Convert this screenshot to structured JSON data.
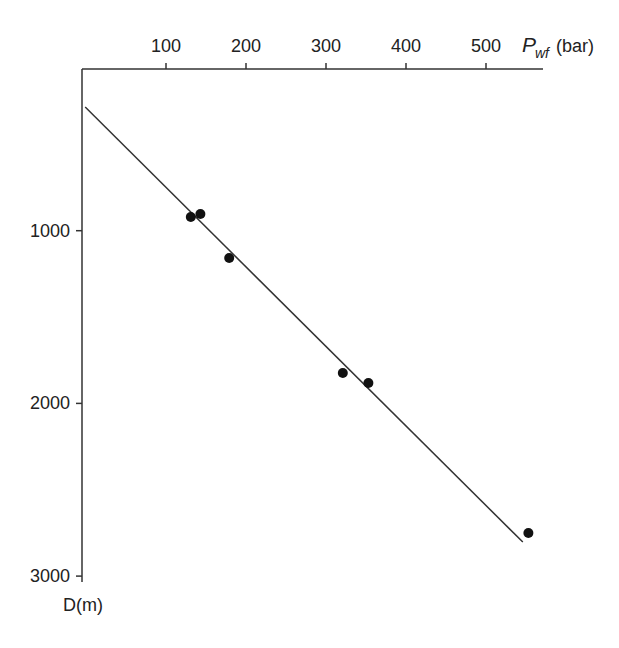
{
  "chart_data": {
    "type": "scatter",
    "title": "",
    "xlabel": "Pwf (bar)",
    "xlabel_main": "P",
    "xlabel_sub": "wf",
    "xlabel_unit": "(bar)",
    "ylabel": "D(m)",
    "x_axis_position": "top",
    "y_axis_inverted": true,
    "xlim": [
      0,
      570
    ],
    "ylim": [
      3000,
      64
    ],
    "x_ticks": [
      100,
      200,
      300,
      400,
      500
    ],
    "y_ticks": [
      1000,
      2000,
      3000
    ],
    "grid": false,
    "legend": null,
    "series": [
      {
        "name": "measured",
        "type": "scatter",
        "points": [
          {
            "x": 131,
            "y": 921
          },
          {
            "x": 143,
            "y": 903
          },
          {
            "x": 179,
            "y": 1158
          },
          {
            "x": 321,
            "y": 1824
          },
          {
            "x": 353,
            "y": 1882
          },
          {
            "x": 553,
            "y": 2750
          }
        ]
      },
      {
        "name": "fit line",
        "type": "line",
        "points": [
          {
            "x": -1,
            "y": 284
          },
          {
            "x": 546,
            "y": 2803
          }
        ]
      }
    ]
  }
}
